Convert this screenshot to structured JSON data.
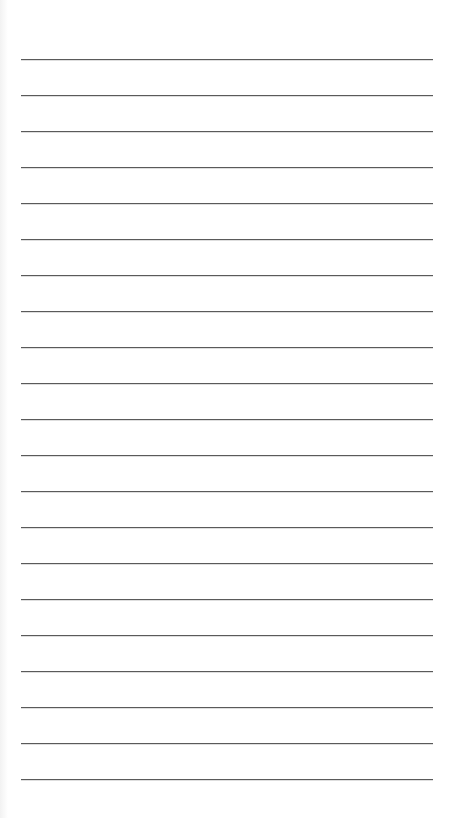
{
  "page": {
    "type": "lined-paper",
    "background": "#ffffff",
    "line_color": "#5a5a5a",
    "line_count": 21,
    "first_line_y": 59,
    "line_spacing": 36,
    "line_left": 21,
    "line_width": 412
  }
}
